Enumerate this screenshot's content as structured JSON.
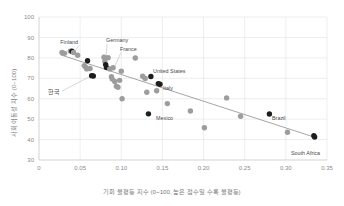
{
  "chart_data": {
    "type": "scatter",
    "title": "",
    "xlabel": "기회 불평등 지수 (0~100, 높은 점수일 수록 불평등)",
    "ylabel": "사회 이동성 지수 (0~100)",
    "xlim": [
      0,
      0.35
    ],
    "ylim": [
      30,
      100
    ],
    "grid": true,
    "legend": "none",
    "xticks": [
      "0",
      "0.05",
      "0.10",
      "0.15",
      "0.20",
      "0.25",
      "0.30",
      "0.35"
    ],
    "xtick_values": [
      0,
      0.05,
      0.1,
      0.15,
      0.2,
      0.25,
      0.3,
      0.35
    ],
    "yticks": [
      "30",
      "40",
      "50",
      "60",
      "70",
      "80",
      "90",
      "100"
    ],
    "ytick_values": [
      30,
      40,
      50,
      60,
      70,
      80,
      90,
      100
    ],
    "trendline": {
      "type": "linear",
      "x_start": 0.026,
      "y_start": 81.5,
      "x_end": 0.336,
      "y_end": 41.0
    },
    "points": [
      {
        "x": 0.028,
        "y": 82.6,
        "highlight": false,
        "label": ""
      },
      {
        "x": 0.031,
        "y": 82.2,
        "highlight": false,
        "label": ""
      },
      {
        "x": 0.038,
        "y": 83.3,
        "highlight": false,
        "label": ""
      },
      {
        "x": 0.04,
        "y": 83.2,
        "highlight": true,
        "label": "Finland"
      },
      {
        "x": 0.042,
        "y": 82.6,
        "highlight": false,
        "label": ""
      },
      {
        "x": 0.047,
        "y": 81.3,
        "highlight": false,
        "label": ""
      },
      {
        "x": 0.055,
        "y": 76.2,
        "highlight": false,
        "label": ""
      },
      {
        "x": 0.057,
        "y": 75.3,
        "highlight": false,
        "label": ""
      },
      {
        "x": 0.058,
        "y": 74.6,
        "highlight": false,
        "label": ""
      },
      {
        "x": 0.059,
        "y": 78.6,
        "highlight": true,
        "label": ""
      },
      {
        "x": 0.062,
        "y": 74.8,
        "highlight": false,
        "label": ""
      },
      {
        "x": 0.064,
        "y": 71.3,
        "highlight": true,
        "label": "한국"
      },
      {
        "x": 0.066,
        "y": 71.1,
        "highlight": true,
        "label": ""
      },
      {
        "x": 0.079,
        "y": 80.3,
        "highlight": false,
        "label": ""
      },
      {
        "x": 0.08,
        "y": 78.4,
        "highlight": false,
        "label": ""
      },
      {
        "x": 0.081,
        "y": 76.7,
        "highlight": true,
        "label": "Germany"
      },
      {
        "x": 0.082,
        "y": 75.3,
        "highlight": true,
        "label": ""
      },
      {
        "x": 0.084,
        "y": 80.1,
        "highlight": false,
        "label": "France"
      },
      {
        "x": 0.086,
        "y": 74.6,
        "highlight": false,
        "label": ""
      },
      {
        "x": 0.088,
        "y": 70.8,
        "highlight": false,
        "label": ""
      },
      {
        "x": 0.089,
        "y": 69.6,
        "highlight": false,
        "label": ""
      },
      {
        "x": 0.09,
        "y": 75.2,
        "highlight": false,
        "label": ""
      },
      {
        "x": 0.092,
        "y": 68.4,
        "highlight": false,
        "label": ""
      },
      {
        "x": 0.094,
        "y": 66.1,
        "highlight": false,
        "label": ""
      },
      {
        "x": 0.096,
        "y": 65.6,
        "highlight": false,
        "label": ""
      },
      {
        "x": 0.098,
        "y": 69.0,
        "highlight": false,
        "label": ""
      },
      {
        "x": 0.1,
        "y": 73.5,
        "highlight": false,
        "label": ""
      },
      {
        "x": 0.101,
        "y": 60.0,
        "highlight": false,
        "label": ""
      },
      {
        "x": 0.117,
        "y": 79.9,
        "highlight": false,
        "label": ""
      },
      {
        "x": 0.126,
        "y": 71.0,
        "highlight": false,
        "label": ""
      },
      {
        "x": 0.129,
        "y": 69.9,
        "highlight": false,
        "label": ""
      },
      {
        "x": 0.131,
        "y": 63.2,
        "highlight": false,
        "label": ""
      },
      {
        "x": 0.133,
        "y": 52.6,
        "highlight": true,
        "label": "Mexico"
      },
      {
        "x": 0.136,
        "y": 70.9,
        "highlight": true,
        "label": "United States"
      },
      {
        "x": 0.143,
        "y": 63.9,
        "highlight": false,
        "label": ""
      },
      {
        "x": 0.145,
        "y": 67.4,
        "highlight": true,
        "label": "Italy"
      },
      {
        "x": 0.147,
        "y": 67.1,
        "highlight": true,
        "label": ""
      },
      {
        "x": 0.156,
        "y": 57.6,
        "highlight": false,
        "label": ""
      },
      {
        "x": 0.184,
        "y": 54.0,
        "highlight": false,
        "label": ""
      },
      {
        "x": 0.201,
        "y": 45.8,
        "highlight": false,
        "label": ""
      },
      {
        "x": 0.228,
        "y": 60.4,
        "highlight": false,
        "label": ""
      },
      {
        "x": 0.245,
        "y": 51.4,
        "highlight": false,
        "label": ""
      },
      {
        "x": 0.28,
        "y": 52.5,
        "highlight": true,
        "label": "Brazil"
      },
      {
        "x": 0.302,
        "y": 43.6,
        "highlight": false,
        "label": ""
      },
      {
        "x": 0.334,
        "y": 41.9,
        "highlight": true,
        "label": "South Africa"
      },
      {
        "x": 0.335,
        "y": 41.2,
        "highlight": true,
        "label": ""
      }
    ],
    "annotations": [
      {
        "name": "Finland",
        "text": "Finland"
      },
      {
        "name": "Germany",
        "text": "Germany"
      },
      {
        "name": "France",
        "text": "France"
      },
      {
        "name": "한국",
        "text": "한국"
      },
      {
        "name": "United States",
        "text": "United States"
      },
      {
        "name": "Italy",
        "text": "Italy"
      },
      {
        "name": "Mexico",
        "text": "Mexico"
      },
      {
        "name": "Brazil",
        "text": "Brazil"
      },
      {
        "name": "South Africa",
        "text": "South Africa"
      }
    ],
    "colors": {
      "highlight_marker": "#1d1d1d",
      "plain_marker": "#9d9d9d",
      "trendline": "#8f8f8f",
      "grid": "#e2e2e2",
      "axis": "#cfcfcf",
      "tick_text": "#8a8a8a",
      "label_text": "#4a4a4a",
      "background": "#ffffff"
    }
  }
}
